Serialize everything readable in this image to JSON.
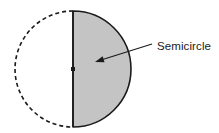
{
  "figure": {
    "background_color": "#ffffff",
    "width": 219,
    "height": 133
  },
  "geometry": {
    "circle": {
      "center_x": 73,
      "center_y": 69,
      "radius": 58
    },
    "shaded_half": {
      "name": "right half",
      "fill_color": "#c4c4c4",
      "stroke_color": "#1a1a1a",
      "stroke_width": 1.6,
      "style": "solid"
    },
    "dashed_half": {
      "name": "left half",
      "fill_color": "none",
      "stroke_color": "#1a1a1a",
      "stroke_width": 1.6,
      "style": "dashed",
      "dash_pattern": "4 3"
    },
    "diameter_line": {
      "x": 73,
      "y_top": 11,
      "y_bottom": 127,
      "stroke_color": "#1a1a1a",
      "stroke_width": 1.6
    },
    "center_point": {
      "x": 73,
      "y": 69,
      "color": "#1a1a1a",
      "size": 4
    }
  },
  "annotation": {
    "label": "Semicircle",
    "label_x": 157,
    "label_y": 50,
    "leader_start_x": 152,
    "leader_start_y": 44,
    "leader_end_x": 97,
    "leader_end_y": 61,
    "arrow_tip_x": 95,
    "arrow_tip_y": 62,
    "stroke_color": "#1a1a1a",
    "stroke_width": 1.1
  }
}
